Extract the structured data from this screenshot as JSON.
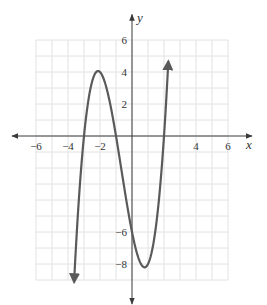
{
  "chart_data": {
    "type": "line",
    "title": "",
    "xlabel": "x",
    "ylabel": "y",
    "xlim": [
      -6,
      6
    ],
    "ylim": [
      -9,
      6
    ],
    "x_axis_range": [
      -7.5,
      7.5
    ],
    "y_axis_range": [
      -10.5,
      7.6
    ],
    "grid": true,
    "grid_step": 1,
    "x_ticks": [
      -6,
      -4,
      -2,
      4,
      6
    ],
    "x_tick_labels": [
      "−6",
      "−4",
      "−2",
      "4",
      "6"
    ],
    "y_ticks": [
      6,
      4,
      2,
      -6,
      -8
    ],
    "y_tick_labels": [
      "6",
      "4",
      "2",
      "−6",
      "−8"
    ],
    "series": [
      {
        "name": "f(x) = x^3 + 2x^2 - 5x - 6",
        "function": "x^3 + 2*x^2 - 5*x - 6",
        "x_domain": [
          -3.62,
          2.27
        ],
        "arrow_ends": true,
        "key_points": [
          {
            "x": -3,
            "y": 0,
            "label": "root"
          },
          {
            "x": -2.12,
            "y": 4.06,
            "label": "local max"
          },
          {
            "x": -1,
            "y": 0,
            "label": "root"
          },
          {
            "x": 0,
            "y": -6,
            "label": "y-intercept"
          },
          {
            "x": 0.79,
            "y": -8.21,
            "label": "local min"
          },
          {
            "x": 2,
            "y": 0,
            "label": "root"
          }
        ],
        "color": "#5a5a5a"
      }
    ]
  }
}
